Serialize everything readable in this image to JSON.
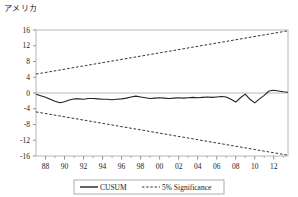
{
  "chart_data": {
    "type": "line",
    "title": "アメリカ",
    "xlabel": "",
    "ylabel": "",
    "ylim": [
      -16,
      16
    ],
    "yticks": [
      16,
      12,
      8,
      4,
      0,
      -4,
      -8,
      -12,
      -16
    ],
    "xticks": [
      "88",
      "90",
      "92",
      "94",
      "96",
      "98",
      "00",
      "02",
      "04",
      "06",
      "08",
      "10",
      "12"
    ],
    "xlim": [
      1987.0,
      2013.5
    ],
    "grid": false,
    "legend_position": "bottom-center",
    "series": [
      {
        "name": "CUSUM",
        "style": "solid",
        "color": "#222222",
        "x": [
          1987.0,
          1987.5,
          1988.0,
          1988.5,
          1989.0,
          1989.5,
          1990.0,
          1990.5,
          1991.0,
          1991.5,
          1992.0,
          1992.5,
          1993.0,
          1993.5,
          1994.0,
          1994.5,
          1995.0,
          1995.5,
          1996.0,
          1996.5,
          1997.0,
          1997.5,
          1998.0,
          1998.5,
          1999.0,
          1999.5,
          2000.0,
          2000.5,
          2001.0,
          2001.5,
          2002.0,
          2002.5,
          2003.0,
          2003.5,
          2004.0,
          2004.5,
          2005.0,
          2005.5,
          2006.0,
          2006.5,
          2007.0,
          2007.5,
          2008.0,
          2008.5,
          2009.0,
          2009.5,
          2010.0,
          2010.5,
          2011.0,
          2011.5,
          2012.0,
          2012.5,
          2013.0,
          2013.5
        ],
        "y": [
          -0.3,
          -0.7,
          -1.1,
          -1.6,
          -2.1,
          -2.5,
          -2.2,
          -1.8,
          -1.5,
          -1.5,
          -1.6,
          -1.4,
          -1.4,
          -1.5,
          -1.6,
          -1.6,
          -1.7,
          -1.6,
          -1.5,
          -1.3,
          -1.0,
          -0.8,
          -1.0,
          -1.2,
          -1.4,
          -1.3,
          -1.2,
          -1.3,
          -1.4,
          -1.3,
          -1.2,
          -1.3,
          -1.2,
          -1.1,
          -1.2,
          -1.1,
          -1.0,
          -1.1,
          -1.0,
          -0.9,
          -1.0,
          -1.6,
          -2.3,
          -1.2,
          -0.3,
          -1.6,
          -2.5,
          -1.5,
          -0.6,
          0.5,
          0.7,
          0.5,
          0.3,
          0.2
        ]
      },
      {
        "name": "5% Significance",
        "style": "dashed",
        "color": "#333333",
        "x": [
          1987.0,
          2013.5
        ],
        "y": [
          4.8,
          15.8
        ]
      },
      {
        "name": "5% Significance Lower",
        "style": "dashed",
        "color": "#333333",
        "x": [
          1987.0,
          2013.5
        ],
        "y": [
          -4.8,
          -15.8
        ]
      }
    ],
    "legend": [
      {
        "label": "CUSUM",
        "style": "solid"
      },
      {
        "label": "5% Significance",
        "style": "dashed"
      }
    ]
  }
}
